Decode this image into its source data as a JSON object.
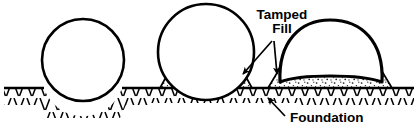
{
  "figure": {
    "background_color": "#ffffff",
    "ink_color": "#000000",
    "width": 418,
    "height": 126
  },
  "labels": {
    "tamped_fill_line1": "Tamped",
    "tamped_fill_line2": "Fill",
    "foundation": "Foundation"
  },
  "annotations": {
    "tamped_fill": {
      "text": "Tamped Fill",
      "leader_arrows": 2,
      "points_to": "stippled fill wedges beside pipes 2 and 3"
    },
    "foundation": {
      "text": "Foundation",
      "leader_arrows": 1,
      "points_to": "hatched ground below grade line"
    }
  },
  "elements": {
    "pipe_1": {
      "name": "unbedded-round-pipe",
      "shape": "circle",
      "cx": 83,
      "cy": 60,
      "r": 41,
      "bedding": "none - settled into native soil"
    },
    "pipe_2": {
      "name": "round-pipe-on-tamped-fill",
      "shape": "circle",
      "cx": 206,
      "cy": 52,
      "r": 48,
      "bedding": "tamped fill"
    },
    "pipe_3": {
      "name": "deformed-flattened-pipe",
      "shape": "flattened dome",
      "cx": 330,
      "cy": 56,
      "bedding": "tamped fill"
    },
    "grade_line": {
      "name": "ground-surface-line",
      "y": 88,
      "x_start": 4,
      "x_end": 414
    },
    "foundation_hatch": {
      "name": "foundation-hatching",
      "pattern": "angled tick hatching"
    },
    "fill_texture": {
      "name": "tamped-fill-stipple",
      "pattern": "random dots / stipple"
    }
  }
}
